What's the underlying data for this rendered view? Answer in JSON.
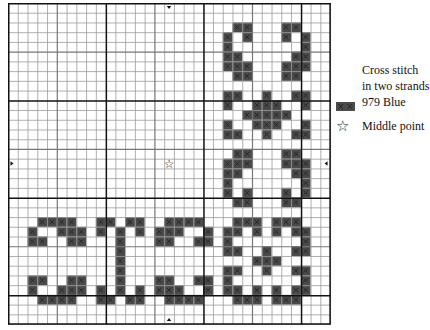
{
  "pattern": {
    "cols": 33,
    "rows": 33,
    "cell_w": 9.76,
    "cell_h": 9.73,
    "thread_color": "#4a4a4a",
    "cross_color": "#222222",
    "grid_color_thin": "#9a9a9a",
    "grid_color_thick": "#111111",
    "thick_every": 10,
    "middle_point": {
      "col": 16,
      "row": 16,
      "symbol": "☆"
    },
    "center_markers": [
      {
        "position": "top",
        "symbol": "▾"
      },
      {
        "position": "bottom",
        "symbol": "▴"
      },
      {
        "position": "left",
        "symbol": "▸"
      },
      {
        "position": "right",
        "symbol": "◂"
      }
    ],
    "stitches": {
      "2": [
        23,
        24,
        28,
        29
      ],
      "3": [
        22,
        24,
        28,
        30
      ],
      "4": [
        22,
        30
      ],
      "5": [
        22,
        23,
        29,
        30
      ],
      "6": [
        22,
        23,
        24,
        28,
        29,
        30
      ],
      "7": [
        23,
        24,
        28,
        29
      ],
      "9": [
        22,
        23,
        26,
        29,
        30
      ],
      "10": [
        22,
        25,
        26,
        27,
        30
      ],
      "11": [
        24,
        25,
        26,
        27,
        28
      ],
      "12": [
        22,
        25,
        26,
        27,
        30
      ],
      "13": [
        22,
        23,
        26,
        29,
        30
      ],
      "15": [
        23,
        24,
        28,
        29
      ],
      "16": [
        22,
        23,
        24,
        28,
        29,
        30
      ],
      "17": [
        22,
        23,
        29,
        30
      ],
      "18": [
        22,
        30
      ],
      "19": [
        22,
        24,
        28,
        30
      ],
      "20": [
        23,
        24,
        28,
        29
      ],
      "22": [
        3,
        4,
        5,
        6,
        9,
        10,
        12,
        13,
        16,
        17,
        18,
        19,
        23,
        24,
        25,
        27,
        28,
        29
      ],
      "23": [
        2,
        5,
        6,
        7,
        9,
        11,
        13,
        15,
        16,
        17,
        20,
        22,
        23,
        25,
        27,
        29,
        30
      ],
      "24": [
        2,
        3,
        6,
        7,
        11,
        15,
        16,
        19,
        20,
        22,
        30
      ],
      "25": [
        11,
        22,
        23,
        26,
        29,
        30
      ],
      "26": [
        11,
        25,
        26,
        27
      ],
      "27": [
        11,
        22,
        23,
        26,
        29,
        30
      ],
      "28": [
        2,
        3,
        6,
        7,
        11,
        15,
        16,
        19,
        20,
        22,
        30
      ],
      "29": [
        2,
        5,
        6,
        7,
        9,
        11,
        13,
        15,
        16,
        17,
        20,
        22,
        23,
        25,
        27,
        29,
        30
      ],
      "30": [
        3,
        4,
        5,
        6,
        9,
        10,
        12,
        13,
        16,
        17,
        18,
        19,
        23,
        24,
        25,
        27,
        28,
        29
      ]
    }
  },
  "legend": {
    "stitch_line1": "Cross stitch",
    "stitch_line2": "in two strands",
    "stitch_color_label": "979 Blue",
    "swatch_color": "#4a4a4a",
    "middle_point_symbol": "☆",
    "middle_point_label": "Middle point"
  }
}
